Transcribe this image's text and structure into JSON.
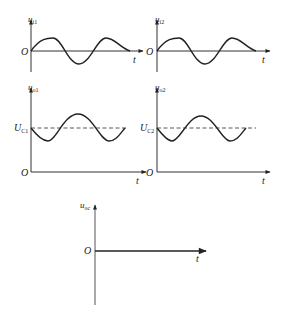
{
  "diagram": {
    "colors": {
      "ink": "#222222",
      "axis": "#333333",
      "dashed": "#444444",
      "background": "#ffffff"
    },
    "panels": [
      {
        "id": "ui1",
        "ylabel_main": "u",
        "ylabel_sub": "i1",
        "origin": "O",
        "xlabel": "t",
        "waveform": "sine",
        "dc_level": null
      },
      {
        "id": "ui2",
        "ylabel_main": "u",
        "ylabel_sub": "i2",
        "origin": "O",
        "xlabel": "t",
        "waveform": "sine",
        "dc_level": null
      },
      {
        "id": "uo1",
        "ylabel_main": "u",
        "ylabel_sub": "o1",
        "origin": "O",
        "xlabel": "t",
        "waveform": "inverted sine offset by DC",
        "dc_level": {
          "main": "U",
          "sub": "C1"
        }
      },
      {
        "id": "uo2",
        "ylabel_main": "u",
        "ylabel_sub": "o2",
        "origin": "O",
        "xlabel": "t",
        "waveform": "inverted sine offset by DC",
        "dc_level": {
          "main": "U",
          "sub": "C2"
        }
      },
      {
        "id": "uoc",
        "ylabel_main": "u",
        "ylabel_sub": "oc",
        "origin": "O",
        "xlabel": "t",
        "waveform": "zero",
        "dc_level": null
      }
    ]
  }
}
